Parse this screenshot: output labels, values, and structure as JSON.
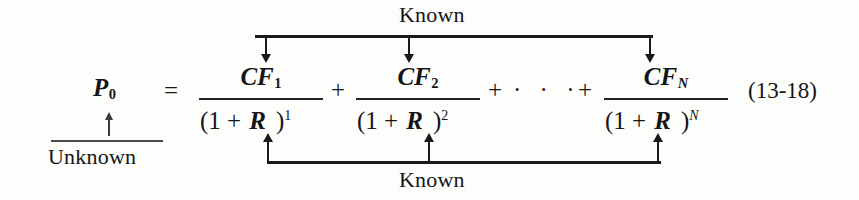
{
  "figure": {
    "type": "annotated-equation",
    "equation_number": "(13-18)",
    "left_side": {
      "symbol": "P",
      "subscript": "0"
    },
    "relation": "=",
    "annotations": {
      "top_label": "Known",
      "bottom_label": "Known",
      "left_label": "Unknown"
    },
    "terms": [
      {
        "numerator_symbol": "CF",
        "numerator_subscript": "1",
        "denominator_open": "(1 +",
        "denominator_rate": "R",
        "denominator_close": ")",
        "exponent": "1"
      },
      {
        "numerator_symbol": "CF",
        "numerator_subscript": "2",
        "denominator_open": "(1 +",
        "denominator_rate": "R",
        "denominator_close": ")",
        "exponent": "2"
      },
      {
        "numerator_symbol": "CF",
        "numerator_subscript": "N",
        "denominator_open": "(1 +",
        "denominator_rate": "R",
        "denominator_close": ")",
        "exponent": "N"
      }
    ],
    "operators": {
      "plus_1": "+",
      "plus_2": "+",
      "ellipsis": "· · ·",
      "plus_3": "+"
    },
    "colors": {
      "ink": "#151515",
      "rule": "#1a1a1a",
      "background": "#fdfdfc"
    }
  }
}
